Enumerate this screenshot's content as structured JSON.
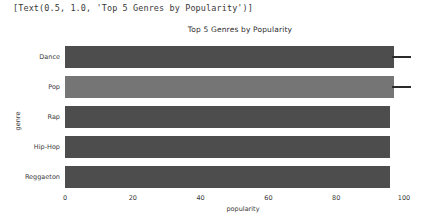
{
  "console_repr": "[Text(0.5, 1.0, 'Top 5 Genres by Popularity')]",
  "chart_data": {
    "type": "bar",
    "orientation": "horizontal",
    "title": "Top 5 Genres by Popularity",
    "xlabel": "popularity",
    "ylabel": "genre",
    "categories": [
      "Dance",
      "Pop",
      "Rap",
      "Hip-Hop",
      "Reggaeton"
    ],
    "values": [
      97,
      97,
      96,
      96,
      96
    ],
    "xlim": [
      0,
      105
    ],
    "xticks": [
      0,
      20,
      40,
      60,
      80,
      100
    ],
    "xtick_labels": [
      "0",
      "20",
      "40",
      "60",
      "80",
      "100"
    ],
    "grid": false,
    "legend": null,
    "bar_colors": [
      "#4d4d4d",
      "#757575",
      "#4d4d4d",
      "#4d4d4d",
      "#4d4d4d"
    ],
    "markers": [
      {
        "category": "Dance",
        "value": 101
      },
      {
        "category": "Pop",
        "value": 101
      }
    ],
    "marker_color": "#2b2b2b"
  },
  "figure": {
    "background": "#ffffff",
    "text_color": "#3a3a3a"
  }
}
